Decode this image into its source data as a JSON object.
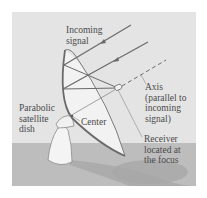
{
  "diagram": {
    "title": "Parabolic satellite dish",
    "colors": {
      "background": "#ffffff",
      "panel": "#e4e4e4",
      "ground": "#bdbdbd",
      "shadow": "#a8a8a8",
      "line": "#6a6a6a",
      "text": "#4a4a4a",
      "dish_face": "#f2f2f2"
    },
    "labels": {
      "incoming_signal": [
        "Incoming",
        "signal"
      ],
      "axis": [
        "Axis",
        "(parallel to",
        "incoming",
        "signal)"
      ],
      "dish": [
        "Parabolic",
        "satellite",
        "dish"
      ],
      "center": [
        "Center"
      ],
      "receiver": [
        "Receiver",
        "located at",
        "the focus"
      ]
    }
  }
}
